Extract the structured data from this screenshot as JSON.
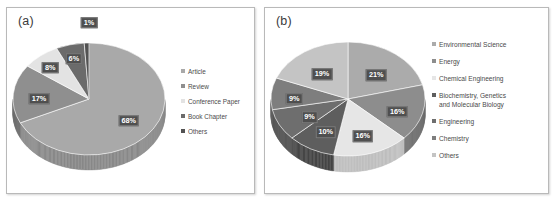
{
  "figure": {
    "background": "#ffffff",
    "panel_border_color": "#b9b9b9"
  },
  "panels": [
    {
      "label": "(a)",
      "name": "panel-a"
    },
    {
      "label": "(b)",
      "name": "panel-b"
    }
  ],
  "chart_data": [
    {
      "type": "pie",
      "title": "(a)",
      "categories": [
        "Article",
        "Review",
        "Conference Paper",
        "Book Chapter",
        "Others"
      ],
      "values": [
        68,
        17,
        8,
        6,
        1
      ],
      "data_labels": [
        "68%",
        "17%",
        "8%",
        "6%",
        "1%"
      ],
      "colors": [
        "#a9a9a9",
        "#8f8f8f",
        "#e3e3e3",
        "#6b6b6b",
        "#525252"
      ],
      "side_colors": [
        "#8a8a8a",
        "#707070",
        "#bdbdbd",
        "#4f4f4f",
        "#3a3a3a"
      ],
      "legend_position": "right",
      "three_d": true,
      "start_angle": 0
    },
    {
      "type": "pie",
      "title": "(b)",
      "categories": [
        "Environmental Science",
        "Energy",
        "Chemical Engineering",
        "Biochemistry, Genetics\nand Molecular Biology",
        "Engineering",
        "Chemistry",
        "Others"
      ],
      "values": [
        21,
        16,
        16,
        10,
        9,
        9,
        19
      ],
      "data_labels": [
        "21%",
        "16%",
        "16%",
        "10%",
        "9%",
        "9%",
        "19%"
      ],
      "colors": [
        "#ababab",
        "#8d8d8d",
        "#e6e6e6",
        "#5e5e5e",
        "#6e6e6e",
        "#7e7e7e",
        "#c4c4c4"
      ],
      "side_colors": [
        "#8c8c8c",
        "#6f6f6f",
        "#c0c0c0",
        "#464646",
        "#545454",
        "#626262",
        "#a2a2a2"
      ],
      "legend_position": "right",
      "three_d": true,
      "start_angle": 0
    }
  ]
}
